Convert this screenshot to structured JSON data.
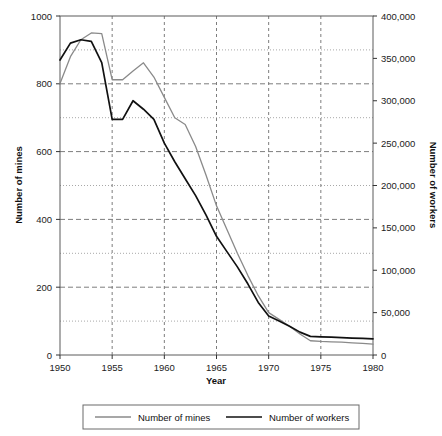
{
  "chart_data": {
    "type": "line",
    "title": "",
    "xlabel": "Year",
    "ylabel": "Number of mines",
    "y2label": "Number of workers",
    "xlim": [
      1950,
      1980
    ],
    "ylim": [
      0,
      1000
    ],
    "y2lim": [
      0,
      400000
    ],
    "grid": true,
    "legend_position": "bottom",
    "x_ticks": [
      "1950",
      "1955",
      "1960",
      "1965",
      "1970",
      "1975",
      "1980"
    ],
    "x_tick_values": [
      1950,
      1955,
      1960,
      1965,
      1970,
      1975,
      1980
    ],
    "y_ticks": [
      "0",
      "200",
      "400",
      "600",
      "800",
      "1000"
    ],
    "y_tick_values": [
      0,
      200,
      400,
      600,
      800,
      1000
    ],
    "y_minor_values": [
      100,
      300,
      500,
      700,
      900
    ],
    "y2_ticks": [
      "0",
      "50,000",
      "100,000",
      "150,000",
      "200,000",
      "250,000",
      "300,000",
      "350,000",
      "400,000"
    ],
    "y2_tick_values": [
      0,
      50000,
      100000,
      150000,
      200000,
      250000,
      300000,
      350000,
      400000
    ],
    "series": [
      {
        "name": "Number of mines",
        "axis": "left",
        "color": "#8a8a8a",
        "x": [
          1950,
          1951,
          1952,
          1953,
          1954,
          1955,
          1956,
          1957,
          1958,
          1959,
          1960,
          1961,
          1962,
          1963,
          1964,
          1965,
          1966,
          1967,
          1968,
          1969,
          1970,
          1971,
          1972,
          1973,
          1974,
          1975,
          1976,
          1977,
          1978,
          1979,
          1980
        ],
        "values": [
          801,
          880,
          930,
          950,
          948,
          812,
          812,
          838,
          862,
          820,
          760,
          700,
          680,
          615,
          530,
          440,
          370,
          300,
          235,
          175,
          125,
          105,
          85,
          62,
          42,
          40,
          39,
          38,
          36,
          34,
          32
        ]
      },
      {
        "name": "Number of workers",
        "axis": "right",
        "color": "#111111",
        "x": [
          1950,
          1951,
          1952,
          1953,
          1954,
          1955,
          1956,
          1957,
          1958,
          1959,
          1960,
          1961,
          1962,
          1963,
          1964,
          1965,
          1966,
          1967,
          1968,
          1969,
          1970,
          1971,
          1972,
          1973,
          1974,
          1975,
          1976,
          1977,
          1978,
          1979,
          1980
        ],
        "values": [
          348000,
          368000,
          372000,
          370000,
          345000,
          278000,
          278000,
          300000,
          290000,
          278000,
          250000,
          228000,
          208000,
          188000,
          165000,
          140000,
          122000,
          104000,
          84000,
          62000,
          46000,
          40000,
          34000,
          27000,
          22000,
          21500,
          21000,
          20500,
          20000,
          19500,
          19000
        ]
      }
    ]
  },
  "legend": {
    "items": [
      {
        "label": "Number of mines",
        "color": "#8a8a8a"
      },
      {
        "label": "Number of workers",
        "color": "#111111"
      }
    ]
  }
}
